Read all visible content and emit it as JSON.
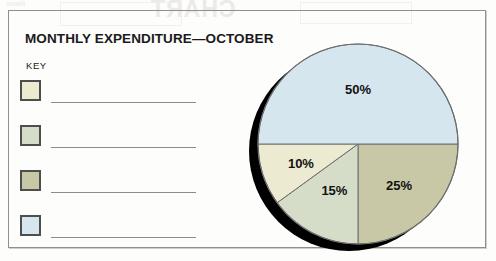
{
  "card": {
    "title": "MONTHLY EXPENDITURE—OCTOBER",
    "key_label": "KEY"
  },
  "legend": {
    "items": [
      {
        "name": "legend-swatch-1",
        "color": "#ecead0",
        "line": ""
      },
      {
        "name": "legend-swatch-2",
        "color": "#d5ddc8",
        "line": ""
      },
      {
        "name": "legend-swatch-3",
        "color": "#c8c7a6",
        "line": ""
      },
      {
        "name": "legend-swatch-4",
        "color": "#d6e6ef",
        "line": ""
      }
    ]
  },
  "bleed": {
    "title": "CHART",
    "small": "Name"
  },
  "chart_data": {
    "type": "pie",
    "title": "MONTHLY EXPENDITURE—OCTOBER",
    "unit": "%",
    "legend_position": "left",
    "labels": [
      "25%",
      "15%",
      "10%",
      "50%"
    ],
    "values": [
      25,
      15,
      10,
      50
    ],
    "categories": [
      "",
      "",
      "",
      ""
    ],
    "colors": [
      "#c8c7a6",
      "#d5ddc8",
      "#ecead0",
      "#d6e6ef"
    ],
    "slices": [
      {
        "label": "25%",
        "value": 25,
        "color": "#c8c7a6",
        "start_deg": 0,
        "end_deg": 90,
        "label_x": 387,
        "label_y": 92
      },
      {
        "label": "15%",
        "value": 15,
        "color": "#d5ddc8",
        "start_deg": 90,
        "end_deg": 144,
        "label_x": 315,
        "label_y": 74
      },
      {
        "label": "10%",
        "value": 10,
        "color": "#ecead0",
        "start_deg": 144,
        "end_deg": 180,
        "label_x": 285,
        "label_y": 116
      },
      {
        "label": "50%",
        "value": 50,
        "color": "#d6e6ef",
        "start_deg": 180,
        "end_deg": 360,
        "label_x": 345,
        "label_y": 186
      }
    ],
    "shadow_color": "#000000",
    "outline_color": "#6f6f6f"
  }
}
